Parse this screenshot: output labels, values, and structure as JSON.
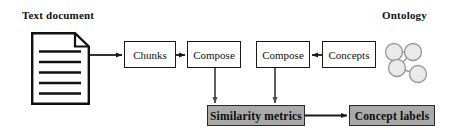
{
  "diagram": {
    "title_left": "Text document",
    "title_right": "Ontology",
    "nodes": {
      "chunks": "Chunks",
      "compose_left": "Compose",
      "compose_right": "Compose",
      "concepts": "Concepts",
      "similarity_metrics": "Similarity metrics",
      "concept_labels": "Concept labels"
    },
    "icons": {
      "document": "document-page-icon",
      "ontology": "ontology-graph-icon"
    },
    "colors": {
      "shaded_fill": "#a9a9a9",
      "plain_fill": "#ffffff",
      "stroke": "#1a1a1a",
      "text": "#111111",
      "node_fill": "#e8e8e8"
    },
    "flow": [
      "Text document -> Chunks",
      "Chunks -> Compose",
      "Compose -> Similarity metrics",
      "Concepts -> Compose",
      "Compose -> Similarity metrics",
      "Similarity metrics -> Concept labels"
    ]
  }
}
